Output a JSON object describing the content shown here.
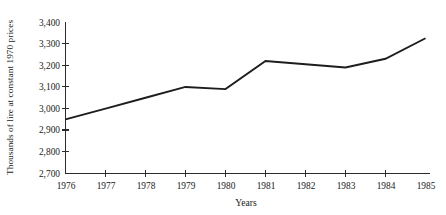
{
  "chart_data": {
    "type": "line",
    "title": "",
    "xlabel": "Years",
    "ylabel": "Thousands of lire at constant 1970 prices",
    "categories": [
      "1976",
      "1977",
      "1978",
      "1979",
      "1980",
      "1981",
      "1982",
      "1983",
      "1984",
      "1985"
    ],
    "x": [
      1976,
      1977,
      1978,
      1979,
      1980,
      1981,
      1982,
      1983,
      1984,
      1985
    ],
    "values": [
      2950,
      3000,
      3050,
      3100,
      3090,
      3220,
      3205,
      3190,
      3230,
      3325
    ],
    "series": [
      {
        "name": "Thousands of lire at constant 1970 prices",
        "values": [
          2950,
          3000,
          3050,
          3100,
          3090,
          3220,
          3205,
          3190,
          3230,
          3325
        ]
      }
    ],
    "ylim": [
      2700,
      3400
    ],
    "yticks": [
      2700,
      2800,
      2900,
      3000,
      3100,
      3200,
      3300,
      3400
    ],
    "ytick_labels": [
      "2,700",
      "2,800",
      "2,900",
      "3,000",
      "3,100",
      "3,200",
      "3,300",
      "3,400"
    ],
    "xtick_labels": [
      "1976",
      "1977",
      "1978",
      "1979",
      "1980",
      "1981",
      "1982",
      "1983",
      "1984",
      "1985"
    ],
    "grid": false,
    "legend": false,
    "legend_position": "none",
    "line_color": "#1d1d1d",
    "axis_color": "#2b2b2b"
  }
}
